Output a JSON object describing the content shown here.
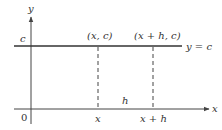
{
  "figure": {
    "type": "diagram",
    "colors": {
      "line": "#333333",
      "axis": "#444444",
      "background": "#ffffff"
    },
    "axes": {
      "x_label": "x",
      "y_label": "y",
      "origin_label": "0"
    },
    "horizontal_line": {
      "equation_label": "y = c",
      "y_intercept_label": "c"
    },
    "points": [
      {
        "label": "(x, c)",
        "x_tick_label": "x"
      },
      {
        "label": "(x + h, c)",
        "x_tick_label": "x + h"
      }
    ],
    "interval_label": "h"
  }
}
